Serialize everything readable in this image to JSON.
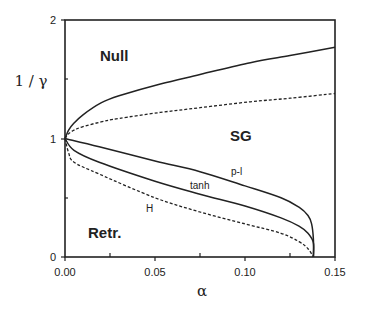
{
  "chart_data": {
    "type": "line",
    "title": "",
    "xlabel": "α",
    "ylabel": "1 / γ",
    "xlim": [
      0.0,
      0.15
    ],
    "ylim": [
      0,
      2
    ],
    "grid": false,
    "legend": "none (curves labeled inline)",
    "x_ticks": [
      "0.00",
      "0.05",
      "0.10",
      "0.15"
    ],
    "y_ticks": [
      "0",
      "1",
      "2"
    ],
    "minor_x_ticks": [
      0.025,
      0.075,
      0.125
    ],
    "minor_y_ticks": [
      0.5,
      1.5
    ],
    "region_labels": [
      {
        "text": "Null",
        "x": 0.025,
        "y": 1.72
      },
      {
        "text": "SG",
        "x": 0.098,
        "y": 1.03
      },
      {
        "text": "Retr.",
        "x": 0.022,
        "y": 0.22
      }
    ],
    "series": [
      {
        "name": "upper solid",
        "style": "solid",
        "label": "",
        "x": [
          0.0,
          0.002,
          0.005,
          0.01,
          0.02,
          0.03,
          0.053,
          0.075,
          0.103,
          0.125,
          0.15
        ],
        "y": [
          1.0,
          1.07,
          1.13,
          1.2,
          1.3,
          1.36,
          1.46,
          1.54,
          1.64,
          1.7,
          1.77
        ]
      },
      {
        "name": "upper dotted",
        "style": "dashed",
        "label": "",
        "x": [
          0.0,
          0.002,
          0.005,
          0.01,
          0.02,
          0.03,
          0.053,
          0.075,
          0.103,
          0.125,
          0.15
        ],
        "y": [
          1.0,
          1.04,
          1.07,
          1.1,
          1.14,
          1.17,
          1.22,
          1.26,
          1.31,
          1.34,
          1.38
        ]
      },
      {
        "name": "p-l",
        "style": "solid",
        "label": "p-l",
        "x": [
          0.0,
          0.019,
          0.05,
          0.075,
          0.1,
          0.12,
          0.13,
          0.135,
          0.137,
          0.138,
          0.138
        ],
        "y": [
          1.0,
          0.93,
          0.81,
          0.72,
          0.6,
          0.5,
          0.42,
          0.35,
          0.28,
          0.15,
          0.0
        ]
      },
      {
        "name": "tanh",
        "style": "solid",
        "label": "tanh",
        "x": [
          0.0,
          0.005,
          0.019,
          0.05,
          0.075,
          0.1,
          0.12,
          0.13,
          0.135,
          0.138,
          0.138
        ],
        "y": [
          1.0,
          0.9,
          0.8,
          0.64,
          0.53,
          0.43,
          0.33,
          0.26,
          0.2,
          0.12,
          0.0
        ]
      },
      {
        "name": "H",
        "style": "dashed",
        "label": "H",
        "x": [
          0.0,
          0.002,
          0.005,
          0.019,
          0.05,
          0.075,
          0.1,
          0.12,
          0.13,
          0.135,
          0.138
        ],
        "y": [
          1.0,
          0.88,
          0.8,
          0.7,
          0.5,
          0.38,
          0.28,
          0.2,
          0.13,
          0.07,
          0.0
        ]
      }
    ],
    "curve_labels": [
      {
        "text": "p-l",
        "x": 0.094,
        "y": 0.73
      },
      {
        "text": "tanh",
        "x": 0.07,
        "y": 0.6
      },
      {
        "text": "H",
        "x": 0.046,
        "y": 0.4
      }
    ]
  },
  "axes": {
    "x_title": "α",
    "y_title": "1 / γ",
    "x_tick_labels": [
      "0.00",
      "0.05",
      "0.10",
      "0.15"
    ],
    "y_tick_labels": [
      "0",
      "1",
      "2"
    ]
  },
  "labels": {
    "null": "Null",
    "sg": "SG",
    "retr": "Retr.",
    "pl": "p-l",
    "tanh": "tanh",
    "h": "H"
  },
  "colors": {
    "ink": "#222222",
    "background": "#ffffff"
  }
}
